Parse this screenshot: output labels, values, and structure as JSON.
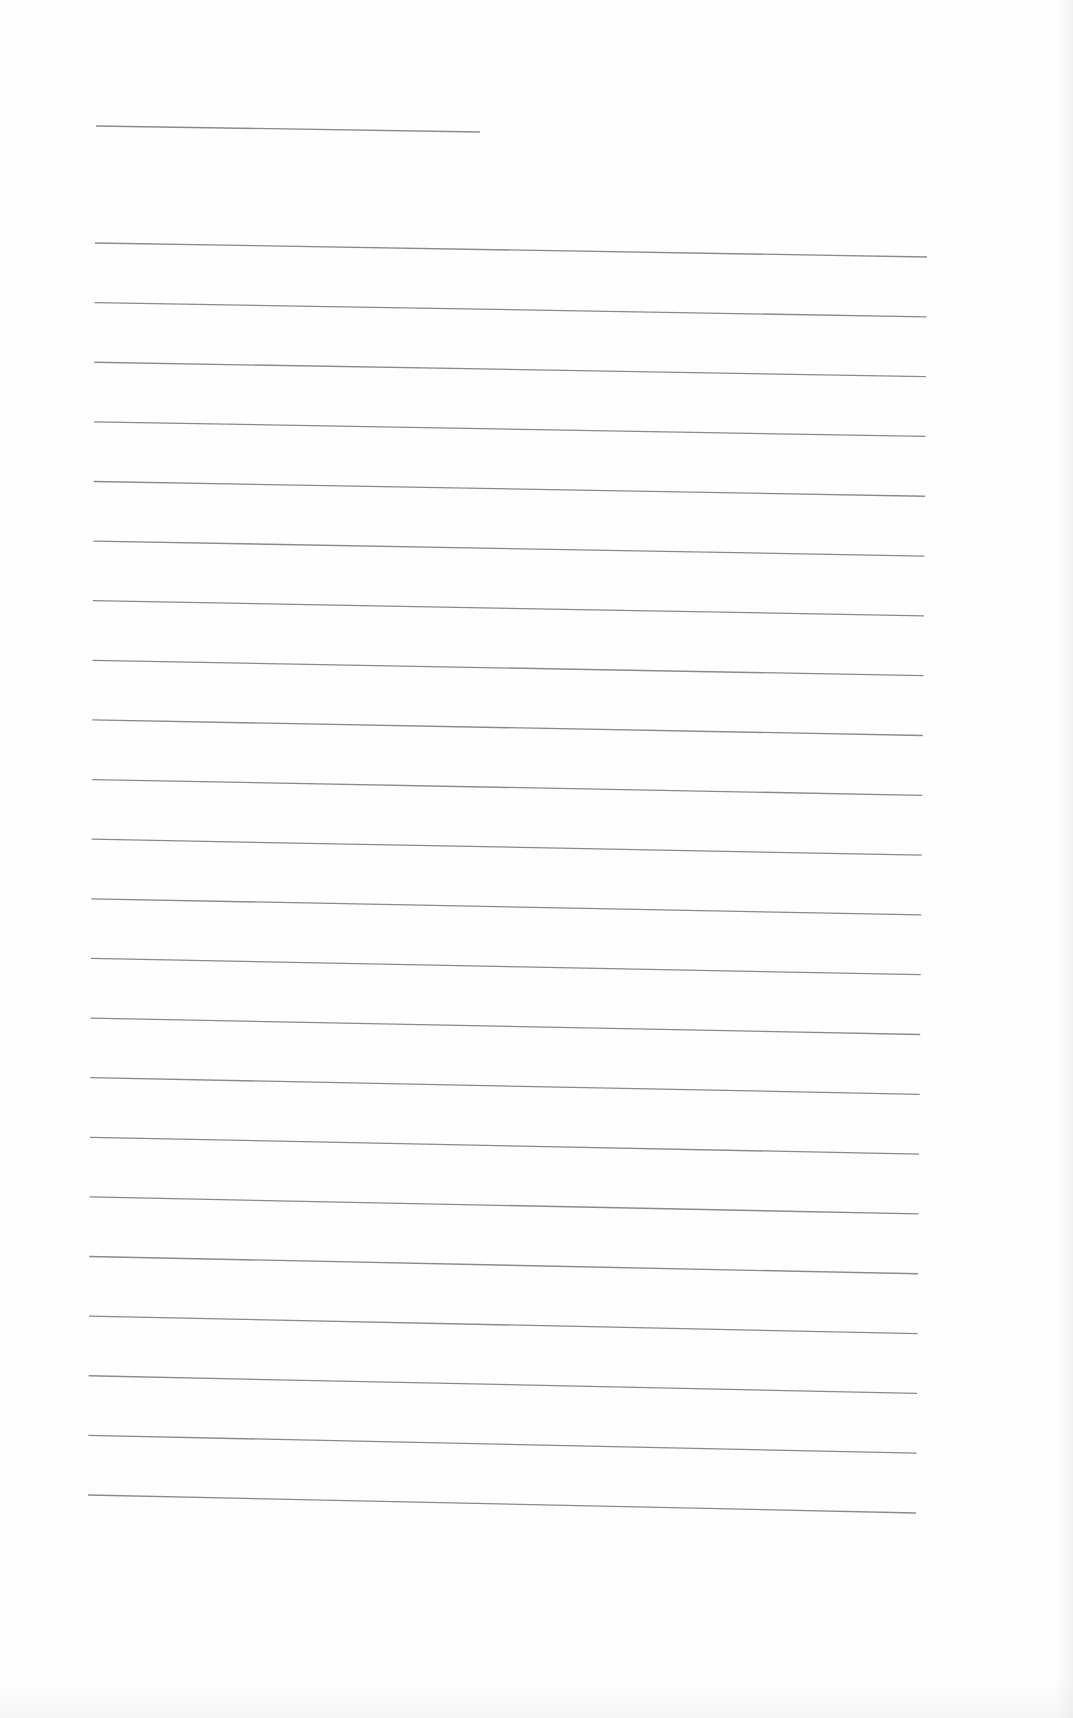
{
  "page": {
    "type": "blank-lined-paper",
    "background": "#fefefe",
    "line_color": "#8a8a8a",
    "title_line": {
      "x1": 96,
      "y1": 126,
      "x2": 480,
      "y2": 132
    },
    "ruled_lines": {
      "count": 22,
      "first": {
        "x1": 95,
        "y1": 243,
        "x2": 927,
        "y2": 257
      },
      "last": {
        "x1": 88,
        "y1": 1495,
        "x2": 916,
        "y2": 1513
      }
    }
  }
}
